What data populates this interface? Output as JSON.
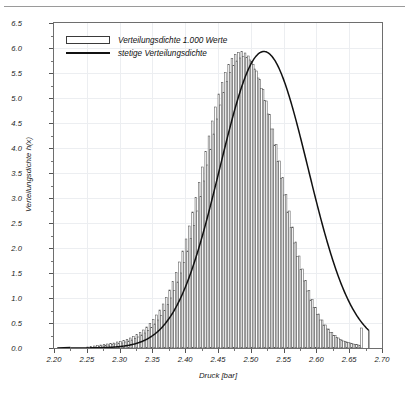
{
  "figure": {
    "top_rule": true,
    "legend": [
      {
        "marker": "bar-swatch",
        "label": "Verteilungsdichte 1.000 Werte"
      },
      {
        "marker": "line-swatch",
        "label": "stetige Verteilungsdichte"
      }
    ],
    "caption": ""
  },
  "chart_data": {
    "type": "bar",
    "title": "",
    "xlabel": "Druck [bar]",
    "ylabel": "Verteilungsdichte h(x)",
    "xlim": [
      2.2,
      2.7
    ],
    "ylim": [
      0.0,
      6.5
    ],
    "grid": true,
    "legend_position": "top-left-inside",
    "xtick_labels": [
      "2.20",
      "2.25",
      "2.30",
      "2.35",
      "2.40",
      "2.45",
      "2.50",
      "2.55",
      "2.60",
      "2.65",
      "2.70"
    ],
    "xtick_values": [
      2.2,
      2.25,
      2.3,
      2.35,
      2.4,
      2.45,
      2.5,
      2.55,
      2.6,
      2.65,
      2.7
    ],
    "ytick_labels": [
      "0.0",
      "0.5",
      "1.0",
      "1.5",
      "2.0",
      "2.5",
      "3.0",
      "3.5",
      "4.0",
      "4.5",
      "5.0",
      "5.5",
      "6.0",
      "6.5"
    ],
    "ytick_values": [
      0.0,
      0.5,
      1.0,
      1.5,
      2.0,
      2.5,
      3.0,
      3.5,
      4.0,
      4.5,
      5.0,
      5.5,
      6.0,
      6.5
    ],
    "series": [
      {
        "name": "Verteilungsdichte 1.000 Werte",
        "type": "bar",
        "color": "#ffffff",
        "edge_color": "#555555",
        "bin_width": 0.0025,
        "bins": [
          2.25,
          2.2525,
          2.255,
          2.2575,
          2.26,
          2.2625,
          2.265,
          2.2675,
          2.27,
          2.2725,
          2.275,
          2.2775,
          2.28,
          2.2825,
          2.285,
          2.2875,
          2.29,
          2.2925,
          2.295,
          2.2975,
          2.3,
          2.3025,
          2.305,
          2.3075,
          2.31,
          2.3125,
          2.315,
          2.3175,
          2.32,
          2.3225,
          2.325,
          2.3275,
          2.33,
          2.3325,
          2.335,
          2.3375,
          2.34,
          2.3425,
          2.345,
          2.3475,
          2.35,
          2.3525,
          2.355,
          2.3575,
          2.36,
          2.3625,
          2.365,
          2.3675,
          2.37,
          2.3725,
          2.375,
          2.3775,
          2.38,
          2.3825,
          2.385,
          2.3875,
          2.39,
          2.3925,
          2.395,
          2.3975,
          2.4,
          2.4025,
          2.405,
          2.4075,
          2.41,
          2.4125,
          2.415,
          2.4175,
          2.42,
          2.4225,
          2.425,
          2.4275,
          2.43,
          2.4325,
          2.435,
          2.4375,
          2.44,
          2.4425,
          2.445,
          2.4475,
          2.45,
          2.4525,
          2.455,
          2.4575,
          2.46,
          2.4625,
          2.465,
          2.4675,
          2.47,
          2.4725,
          2.475,
          2.4775,
          2.48,
          2.4825,
          2.485,
          2.4875,
          2.49,
          2.4925,
          2.495,
          2.4975,
          2.5,
          2.5025,
          2.505,
          2.5075,
          2.51,
          2.5125,
          2.515,
          2.5175,
          2.52,
          2.5225,
          2.525,
          2.5275,
          2.53,
          2.5325,
          2.535,
          2.5375,
          2.54,
          2.5425,
          2.545,
          2.5475,
          2.55,
          2.5525,
          2.555,
          2.5575,
          2.56,
          2.5625,
          2.565,
          2.5675,
          2.57,
          2.5725,
          2.575,
          2.5775,
          2.58,
          2.5825,
          2.585,
          2.5875,
          2.59,
          2.5925,
          2.595,
          2.5975,
          2.6,
          2.6025,
          2.605,
          2.6075,
          2.61,
          2.6125,
          2.615,
          2.6175,
          2.62,
          2.6225,
          2.625,
          2.6275,
          2.63,
          2.6325,
          2.635,
          2.6375,
          2.64,
          2.6425,
          2.645,
          2.6475,
          2.65,
          2.6525,
          2.655,
          2.6575,
          2.66,
          2.6625,
          2.665,
          2.6675
        ],
        "values": [
          0.02,
          0.0,
          0.03,
          0.01,
          0.04,
          0.02,
          0.05,
          0.03,
          0.06,
          0.04,
          0.07,
          0.05,
          0.08,
          0.06,
          0.09,
          0.07,
          0.1,
          0.08,
          0.12,
          0.09,
          0.13,
          0.1,
          0.15,
          0.12,
          0.17,
          0.14,
          0.2,
          0.16,
          0.23,
          0.19,
          0.27,
          0.22,
          0.31,
          0.26,
          0.36,
          0.3,
          0.42,
          0.35,
          0.49,
          0.41,
          0.57,
          0.48,
          0.66,
          0.56,
          0.76,
          0.65,
          0.88,
          0.75,
          1.01,
          0.87,
          1.16,
          1.0,
          1.33,
          1.15,
          1.51,
          1.32,
          1.72,
          1.5,
          1.94,
          1.71,
          2.18,
          1.94,
          2.44,
          2.19,
          2.72,
          2.45,
          3.01,
          2.74,
          3.31,
          3.03,
          3.62,
          3.34,
          3.93,
          3.66,
          4.24,
          3.97,
          4.54,
          4.28,
          4.82,
          4.58,
          5.08,
          4.86,
          5.31,
          5.11,
          5.51,
          5.33,
          5.67,
          5.51,
          5.79,
          5.65,
          5.87,
          5.74,
          5.91,
          5.8,
          5.93,
          5.83,
          5.9,
          5.81,
          5.84,
          5.76,
          5.73,
          5.67,
          5.58,
          5.54,
          5.4,
          5.37,
          5.19,
          5.17,
          4.95,
          4.94,
          4.68,
          4.67,
          4.38,
          4.38,
          4.06,
          4.07,
          3.73,
          3.74,
          3.39,
          3.41,
          3.06,
          3.07,
          2.72,
          2.74,
          2.41,
          2.42,
          2.1,
          2.12,
          1.83,
          1.84,
          1.57,
          1.58,
          1.34,
          1.35,
          1.14,
          1.15,
          0.96,
          0.97,
          0.81,
          0.81,
          0.67,
          0.68,
          0.56,
          0.56,
          0.46,
          0.46,
          0.38,
          0.38,
          0.31,
          0.31,
          0.25,
          0.25,
          0.21,
          0.2,
          0.17,
          0.16,
          0.14,
          0.13,
          0.12,
          0.11,
          0.1,
          0.09,
          0.08,
          0.07,
          0.07,
          0.06,
          0.05,
          0.4
        ]
      },
      {
        "name": "stetige Verteilungsdichte",
        "type": "line",
        "color": "#111111",
        "distribution": "normal",
        "mu": 2.52,
        "sigma": 0.0673,
        "peak_x": 2.52,
        "peak_y": 5.93,
        "x_start": 2.225,
        "x_end": 2.68
      }
    ]
  }
}
